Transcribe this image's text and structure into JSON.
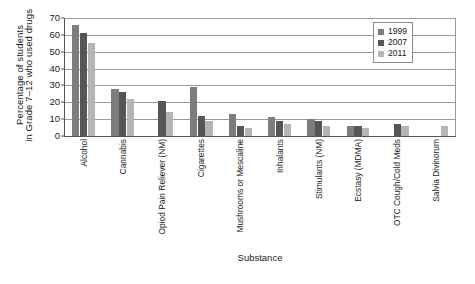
{
  "chart_data": {
    "type": "bar",
    "title": "",
    "xlabel": "Substance",
    "ylabel_line1": "Percentage of students",
    "ylabel_line2": "in Grade 7–12 who used drugs",
    "ylim": [
      0,
      70
    ],
    "yticks": [
      0,
      10,
      20,
      30,
      40,
      50,
      60,
      70
    ],
    "grid": true,
    "legend_position": "top-right",
    "categories": [
      "Alcohol",
      "Cannabis",
      "Opiod Pain Reliever (NM)",
      "Cigarettes",
      "Mushrooms or Mescaline",
      "Inhalants",
      "Stimulants (NM)",
      "Ecstasy (MDMA)",
      "OTC Cough/Cold Meds",
      "Salvia Divinorum"
    ],
    "series": [
      {
        "name": "1999",
        "color": "#7d7d7d",
        "values": [
          66,
          28,
          null,
          29,
          13,
          11,
          10,
          6,
          null,
          null
        ]
      },
      {
        "name": "2007",
        "color": "#565656",
        "values": [
          61,
          26,
          21,
          12,
          6,
          9,
          9,
          6,
          7,
          null
        ]
      },
      {
        "name": "2011",
        "color": "#b5b5b5",
        "values": [
          55,
          22,
          14,
          9,
          5,
          7,
          6,
          5,
          6,
          6
        ]
      }
    ]
  },
  "legend": {
    "items": [
      {
        "label": "1999"
      },
      {
        "label": "2007"
      },
      {
        "label": "2011"
      }
    ]
  }
}
